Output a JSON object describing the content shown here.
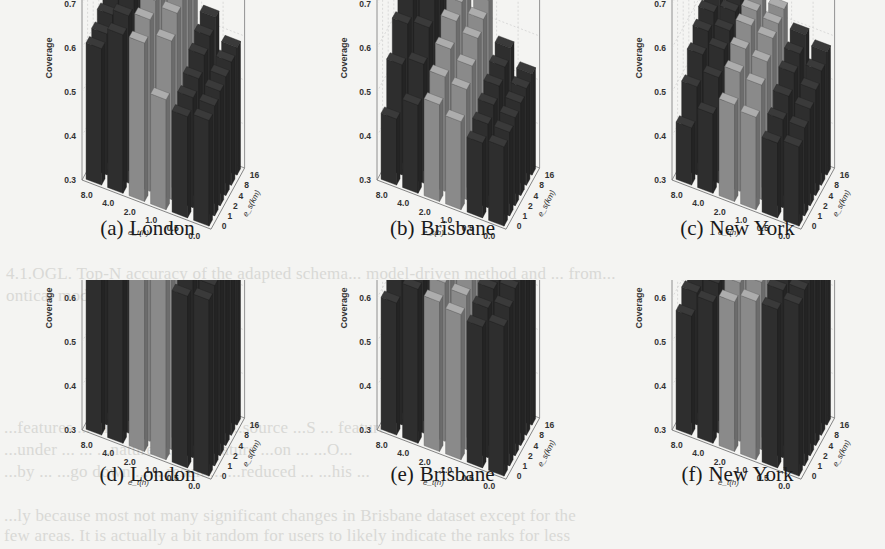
{
  "figure": {
    "bleed_through_text": [
      "4.1.OGL. Top-N accuracy of the adapted schema... model-driven method and ... from...",
      "ontical model",
      "...features ... multi... ...feature...         ...source ...S ... features",
      "...under ... ... ...nature ... ...  ...feature ...on ... ...O...",
      "...by ... ...go down ... ...result ... ...reduced ... ...his ...",
      "...ly because most not many significant changes in Brisbane dataset except for the",
      "few areas. It is actually a bit random for users to likely indicate the ranks for less"
    ]
  },
  "axis_labels": {
    "z": "Coverage",
    "x": "e_t(h)",
    "y": "e_s(km)",
    "z_ticks": [
      "0.3",
      "0.4",
      "0.5",
      "0.6",
      "0.7",
      "0.8",
      "0.9"
    ],
    "x_ticks": [
      "8.0",
      "4.0",
      "2.0",
      "1.0",
      "0.5",
      "0.0"
    ],
    "y_ticks": [
      "0",
      "1",
      "2",
      "4",
      "8",
      "16"
    ]
  },
  "colors": {
    "dark_bar": "#2e2e2e",
    "light_bar": "#8a8a8a",
    "grid": "#c8c8c8",
    "axis": "#777777",
    "background": "#f4f4f2"
  },
  "chart_data": [
    {
      "id": "a",
      "label": "(a)",
      "title": "London",
      "type": "bar3d",
      "xlabel": "e_t(h)",
      "ylabel": "e_s(km)",
      "zlabel": "Coverage",
      "zlim": [
        0.3,
        0.9
      ],
      "x": [
        "8.0",
        "4.0",
        "2.0",
        "1.0",
        "0.5",
        "0.0"
      ],
      "y": [
        "0",
        "1",
        "2",
        "4",
        "8",
        "16"
      ],
      "values": [
        [
          0.61,
          0.66,
          0.66,
          0.55,
          0.53,
          0.54
        ],
        [
          0.62,
          0.68,
          0.69,
          0.66,
          0.55,
          0.55
        ],
        [
          0.64,
          0.7,
          0.71,
          0.7,
          0.57,
          0.56
        ],
        [
          0.68,
          0.72,
          0.73,
          0.72,
          0.6,
          0.57
        ],
        [
          0.7,
          0.73,
          0.74,
          0.73,
          0.62,
          0.58
        ],
        [
          0.72,
          0.74,
          0.75,
          0.74,
          0.64,
          0.59
        ]
      ]
    },
    {
      "id": "b",
      "label": "(b)",
      "title": "Brisbane",
      "type": "bar3d",
      "xlabel": "e_t(h)",
      "ylabel": "e_s(km)",
      "zlabel": "Coverage",
      "zlim": [
        0.3,
        0.9
      ],
      "x": [
        "8.0",
        "4.0",
        "2.0",
        "1.0",
        "0.5",
        "0.0"
      ],
      "y": [
        "0",
        "1",
        "2",
        "4",
        "8",
        "16"
      ],
      "values": [
        [
          0.45,
          0.5,
          0.52,
          0.5,
          0.47,
          0.48
        ],
        [
          0.55,
          0.57,
          0.56,
          0.55,
          0.49,
          0.49
        ],
        [
          0.62,
          0.63,
          0.6,
          0.58,
          0.51,
          0.5
        ],
        [
          0.7,
          0.69,
          0.64,
          0.62,
          0.53,
          0.51
        ],
        [
          0.72,
          0.71,
          0.66,
          0.64,
          0.55,
          0.52
        ],
        [
          0.73,
          0.72,
          0.68,
          0.66,
          0.57,
          0.53
        ]
      ]
    },
    {
      "id": "c",
      "label": "(c)",
      "title": "New York",
      "type": "bar3d",
      "xlabel": "e_t(h)",
      "ylabel": "e_s(km)",
      "zlabel": "Coverage",
      "zlim": [
        0.3,
        0.9
      ],
      "x": [
        "8.0",
        "4.0",
        "2.0",
        "1.0",
        "0.5",
        "0.0"
      ],
      "y": [
        "0",
        "1",
        "2",
        "4",
        "8",
        "16"
      ],
      "values": [
        [
          0.43,
          0.48,
          0.52,
          0.51,
          0.47,
          0.48
        ],
        [
          0.5,
          0.54,
          0.57,
          0.56,
          0.5,
          0.5
        ],
        [
          0.55,
          0.58,
          0.6,
          0.59,
          0.53,
          0.52
        ],
        [
          0.58,
          0.6,
          0.63,
          0.62,
          0.56,
          0.54
        ],
        [
          0.6,
          0.62,
          0.64,
          0.63,
          0.58,
          0.56
        ],
        [
          0.62,
          0.63,
          0.65,
          0.64,
          0.6,
          0.58
        ]
      ]
    },
    {
      "id": "d",
      "label": "(d)",
      "title": "London",
      "type": "bar3d",
      "xlabel": "e_t(h)",
      "ylabel": "e_s(km)",
      "zlabel": "Coverage",
      "zlim": [
        0.3,
        0.9
      ],
      "x": [
        "8.0",
        "4.0",
        "2.0",
        "1.0",
        "0.5",
        "0.0"
      ],
      "y": [
        "0",
        "1",
        "2",
        "4",
        "8",
        "16"
      ],
      "values": [
        [
          0.7,
          0.76,
          0.86,
          0.8,
          0.69,
          0.7
        ],
        [
          0.72,
          0.78,
          0.87,
          0.84,
          0.72,
          0.71
        ],
        [
          0.74,
          0.8,
          0.87,
          0.85,
          0.74,
          0.72
        ],
        [
          0.76,
          0.82,
          0.87,
          0.86,
          0.76,
          0.73
        ],
        [
          0.78,
          0.83,
          0.86,
          0.86,
          0.77,
          0.74
        ],
        [
          0.79,
          0.84,
          0.86,
          0.86,
          0.78,
          0.75
        ]
      ]
    },
    {
      "id": "e",
      "label": "(e)",
      "title": "Brisbane",
      "type": "bar3d",
      "xlabel": "e_t(h)",
      "ylabel": "e_s(km)",
      "zlabel": "Coverage",
      "zlim": [
        0.3,
        0.9
      ],
      "x": [
        "8.0",
        "4.0",
        "2.0",
        "1.0",
        "0.5",
        "0.0"
      ],
      "y": [
        "0",
        "1",
        "2",
        "4",
        "8",
        "16"
      ],
      "values": [
        [
          0.6,
          0.65,
          0.64,
          0.63,
          0.62,
          0.64
        ],
        [
          0.64,
          0.68,
          0.66,
          0.65,
          0.64,
          0.66
        ],
        [
          0.68,
          0.72,
          0.7,
          0.68,
          0.66,
          0.68
        ],
        [
          0.72,
          0.78,
          0.75,
          0.72,
          0.68,
          0.7
        ],
        [
          0.74,
          0.84,
          0.78,
          0.75,
          0.7,
          0.72
        ],
        [
          0.75,
          0.82,
          0.79,
          0.77,
          0.71,
          0.74
        ]
      ]
    },
    {
      "id": "f",
      "label": "(f)",
      "title": "New York",
      "type": "bar3d",
      "xlabel": "e_t(h)",
      "ylabel": "e_s(km)",
      "zlabel": "Coverage",
      "zlim": [
        0.3,
        0.9
      ],
      "x": [
        "8.0",
        "4.0",
        "2.0",
        "1.0",
        "0.5",
        "0.0"
      ],
      "y": [
        "0",
        "1",
        "2",
        "4",
        "8",
        "16"
      ],
      "values": [
        [
          0.57,
          0.62,
          0.64,
          0.66,
          0.66,
          0.69
        ],
        [
          0.6,
          0.64,
          0.66,
          0.68,
          0.68,
          0.7
        ],
        [
          0.62,
          0.65,
          0.68,
          0.7,
          0.7,
          0.71
        ],
        [
          0.64,
          0.66,
          0.7,
          0.72,
          0.72,
          0.72
        ],
        [
          0.65,
          0.67,
          0.71,
          0.73,
          0.73,
          0.73
        ],
        [
          0.66,
          0.68,
          0.72,
          0.74,
          0.74,
          0.74
        ]
      ]
    }
  ]
}
